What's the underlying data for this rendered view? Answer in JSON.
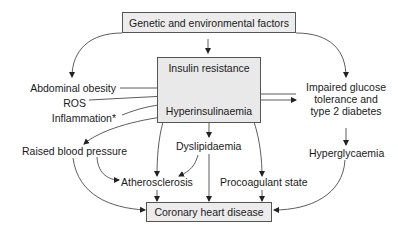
{
  "diagram": {
    "top_box": {
      "label": "Genetic and environmental factors"
    },
    "central_box": {
      "top_label": "Insulin resistance",
      "bottom_label": "Hyperinsulinaemia",
      "arrow_color": "#8a8a8a"
    },
    "bottom_box": {
      "label": "Coronary heart disease"
    },
    "left_inputs": [
      {
        "label": "Abdominal obesity"
      },
      {
        "label": "ROS"
      },
      {
        "label": "Inflammation*"
      }
    ],
    "right_node": {
      "lines": [
        "Impaired glucose",
        "tolerance and",
        "type 2 diabetes"
      ]
    },
    "outcomes": {
      "raised_bp": "Raised blood pressure",
      "dyslipidaemia": "Dyslipidaemia",
      "atherosclerosis": "Atherosclerosis",
      "procoagulant": "Procoagulant state",
      "hyperglycaemia": "Hyperglycaemia"
    },
    "colors": {
      "box_fill": "#ececec",
      "box_border": "#555555",
      "line": "#333333",
      "text": "#1a1a1a"
    }
  }
}
